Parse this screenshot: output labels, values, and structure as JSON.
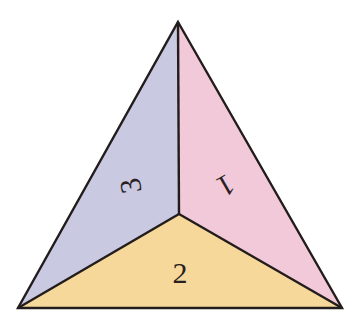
{
  "diagram": {
    "type": "triangle-divided-into-three-faces",
    "colors": {
      "face_1": "#f2c9d8",
      "face_2": "#f6d99a",
      "face_3": "#c9c9e2",
      "stroke": "#231c1c"
    },
    "faces": [
      {
        "id": "1",
        "label": "1"
      },
      {
        "id": "2",
        "label": "2"
      },
      {
        "id": "3",
        "label": "3"
      }
    ]
  }
}
